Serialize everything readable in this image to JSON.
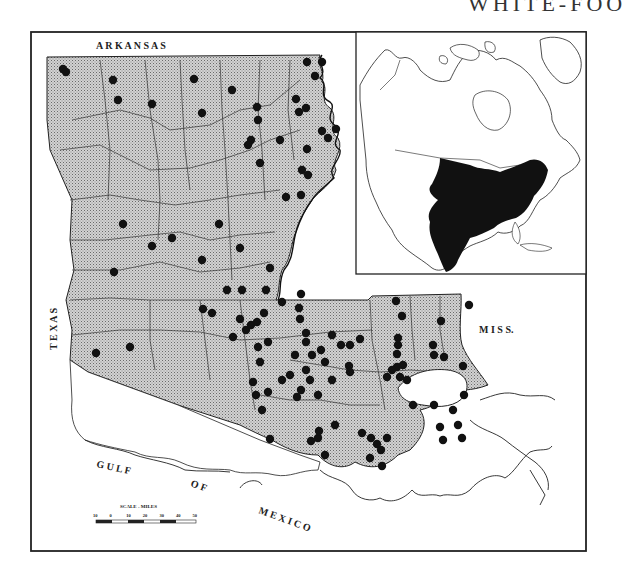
{
  "page": {
    "cut_title_fragment": "WHITE-FOO"
  },
  "colors": {
    "land_stipple": "#bdbdbd",
    "range_fill": "#111111",
    "outline": "#1a1a1a",
    "water": "#ffffff",
    "background": "#ffffff"
  },
  "main_map": {
    "subject": "Louisiana distribution map",
    "labels": {
      "north": "A R K A N S A S",
      "west": "T E X A S",
      "east": "M I S S.",
      "gulf_1": "G U L F",
      "gulf_2": "O F",
      "gulf_3": "M E X I C O"
    },
    "scale_bar": {
      "title": "SCALE - MILES",
      "ticks": [
        "10",
        "0",
        "10",
        "20",
        "30",
        "40",
        "50"
      ]
    },
    "record_dots": [
      [
        63,
        69
      ],
      [
        66,
        72
      ],
      [
        113,
        80
      ],
      [
        118,
        100
      ],
      [
        194,
        79
      ],
      [
        152,
        104
      ],
      [
        232,
        90
      ],
      [
        257,
        107
      ],
      [
        258,
        120
      ],
      [
        202,
        113
      ],
      [
        251,
        140
      ],
      [
        248,
        145
      ],
      [
        260,
        163
      ],
      [
        280,
        140
      ],
      [
        307,
        62
      ],
      [
        322,
        62
      ],
      [
        315,
        76
      ],
      [
        296,
        99
      ],
      [
        306,
        108
      ],
      [
        299,
        112
      ],
      [
        322,
        131
      ],
      [
        336,
        129
      ],
      [
        328,
        138
      ],
      [
        307,
        149
      ],
      [
        302,
        170
      ],
      [
        308,
        175
      ],
      [
        286,
        197
      ],
      [
        301,
        195
      ],
      [
        123,
        224
      ],
      [
        219,
        224
      ],
      [
        152,
        246
      ],
      [
        172,
        238
      ],
      [
        202,
        260
      ],
      [
        240,
        248
      ],
      [
        270,
        268
      ],
      [
        266,
        290
      ],
      [
        114,
        272
      ],
      [
        242,
        290
      ],
      [
        227,
        290
      ],
      [
        203,
        309
      ],
      [
        240,
        319
      ],
      [
        212,
        313
      ],
      [
        264,
        313
      ],
      [
        246,
        330
      ],
      [
        251,
        325
      ],
      [
        257,
        322
      ],
      [
        233,
        337
      ],
      [
        96,
        353
      ],
      [
        130,
        347
      ],
      [
        301,
        294
      ],
      [
        299,
        308
      ],
      [
        300,
        319
      ],
      [
        306,
        333
      ],
      [
        282,
        302
      ],
      [
        306,
        342
      ],
      [
        258,
        347
      ],
      [
        268,
        342
      ],
      [
        260,
        362
      ],
      [
        290,
        375
      ],
      [
        295,
        355
      ],
      [
        312,
        355
      ],
      [
        306,
        370
      ],
      [
        282,
        380
      ],
      [
        321,
        350
      ],
      [
        325,
        362
      ],
      [
        332,
        380
      ],
      [
        318,
        395
      ],
      [
        297,
        397
      ],
      [
        301,
        390
      ],
      [
        332,
        335
      ],
      [
        341,
        345
      ],
      [
        350,
        345
      ],
      [
        360,
        339
      ],
      [
        349,
        366
      ],
      [
        310,
        380
      ],
      [
        350,
        372
      ],
      [
        256,
        395
      ],
      [
        253,
        382
      ],
      [
        268,
        392
      ],
      [
        262,
        410
      ],
      [
        311,
        441
      ],
      [
        318,
        438
      ],
      [
        335,
        425
      ],
      [
        362,
        433
      ],
      [
        325,
        455
      ],
      [
        371,
        438
      ],
      [
        377,
        444
      ],
      [
        387,
        438
      ],
      [
        370,
        458
      ],
      [
        382,
        466
      ],
      [
        381,
        450
      ],
      [
        398,
        345
      ],
      [
        396,
        301
      ],
      [
        402,
        316
      ],
      [
        398,
        338
      ],
      [
        397,
        354
      ],
      [
        403,
        365
      ],
      [
        397,
        367
      ],
      [
        387,
        377
      ],
      [
        392,
        370
      ],
      [
        400,
        377
      ],
      [
        407,
        380
      ],
      [
        441,
        321
      ],
      [
        433,
        345
      ],
      [
        434,
        355
      ],
      [
        444,
        357
      ],
      [
        463,
        366
      ],
      [
        413,
        405
      ],
      [
        434,
        405
      ],
      [
        453,
        410
      ],
      [
        440,
        427
      ],
      [
        458,
        425
      ],
      [
        469,
        305
      ],
      [
        464,
        395
      ],
      [
        462,
        438
      ],
      [
        270,
        439
      ],
      [
        319,
        431
      ],
      [
        443,
        440
      ]
    ]
  },
  "inset_map": {
    "subject": "North America range inset"
  }
}
